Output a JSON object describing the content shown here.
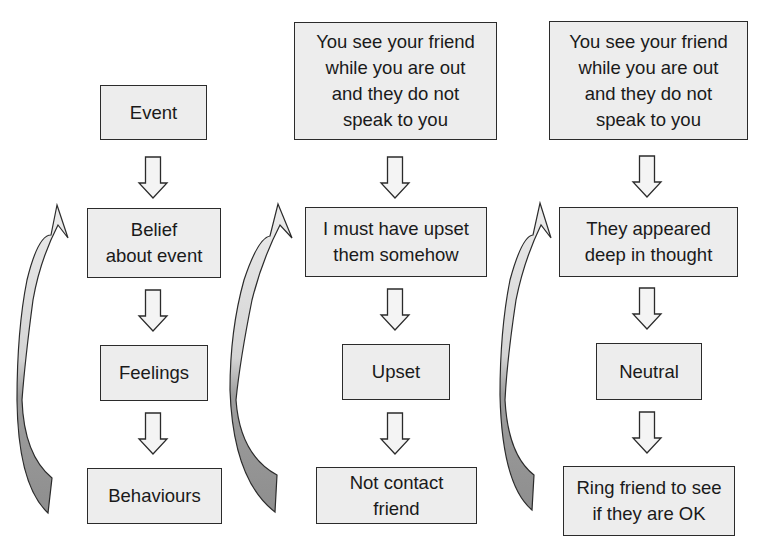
{
  "diagram": {
    "columns": [
      {
        "id": "model",
        "event": "Event",
        "belief": "Belief\nabout event",
        "feeling": "Feelings",
        "behaviour": "Behaviours"
      },
      {
        "id": "negative-example",
        "event": "You see your friend\nwhile you are out\nand they do not\nspeak to you",
        "belief": "I must have upset\nthem somehow",
        "feeling": "Upset",
        "behaviour": "Not contact\nfriend"
      },
      {
        "id": "neutral-example",
        "event": "You see your friend\nwhile you are out\nand they do not\nspeak to you",
        "belief": "They appeared\ndeep in thought",
        "feeling": "Neutral",
        "behaviour": "Ring friend to see\nif they are OK"
      }
    ],
    "colors": {
      "box_fill": "#ededed",
      "box_border": "#2b2b2b",
      "arrow_fill": "#f2f2f2",
      "curve_light": "#e4e4e4",
      "curve_dark": "#9a9a9a"
    }
  }
}
